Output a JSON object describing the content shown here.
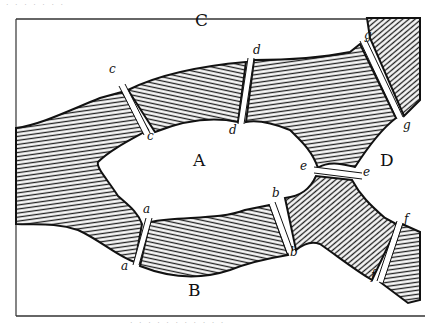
{
  "figure": {
    "landmasses": [
      {
        "id": "A",
        "label": "A",
        "x": 198,
        "y": 160
      },
      {
        "id": "B",
        "label": "B",
        "x": 193,
        "y": 290
      },
      {
        "id": "C",
        "label": "C",
        "x": 200,
        "y": 20
      },
      {
        "id": "D",
        "label": "D",
        "x": 385,
        "y": 160
      }
    ],
    "bridges": [
      {
        "id": "a",
        "ends": [
          {
            "label": "a",
            "x": 146,
            "y": 212
          },
          {
            "label": "a",
            "x": 123,
            "y": 268
          }
        ]
      },
      {
        "id": "b",
        "ends": [
          {
            "label": "b",
            "x": 274,
            "y": 195
          },
          {
            "label": "b",
            "x": 293,
            "y": 253
          }
        ]
      },
      {
        "id": "c",
        "ends": [
          {
            "label": "c",
            "x": 111,
            "y": 63
          },
          {
            "label": "c",
            "x": 148,
            "y": 133
          }
        ]
      },
      {
        "id": "d",
        "ends": [
          {
            "label": "d",
            "x": 254,
            "y": 46
          },
          {
            "label": "d",
            "x": 227,
            "y": 127
          }
        ]
      },
      {
        "id": "e",
        "ends": [
          {
            "label": "e",
            "x": 300,
            "y": 164
          },
          {
            "label": "e",
            "x": 363,
            "y": 170
          }
        ]
      },
      {
        "id": "f",
        "ends": [
          {
            "label": "f",
            "x": 404,
            "y": 215
          },
          {
            "label": "f",
            "x": 370,
            "y": 271
          }
        ]
      },
      {
        "id": "g",
        "ends": [
          {
            "label": "g",
            "x": 365,
            "y": 31
          },
          {
            "label": "g",
            "x": 403,
            "y": 121
          }
        ]
      }
    ],
    "colors": {
      "ink": "#111111",
      "paper": "#ffffff",
      "hatch": "#2a2a2a"
    }
  }
}
